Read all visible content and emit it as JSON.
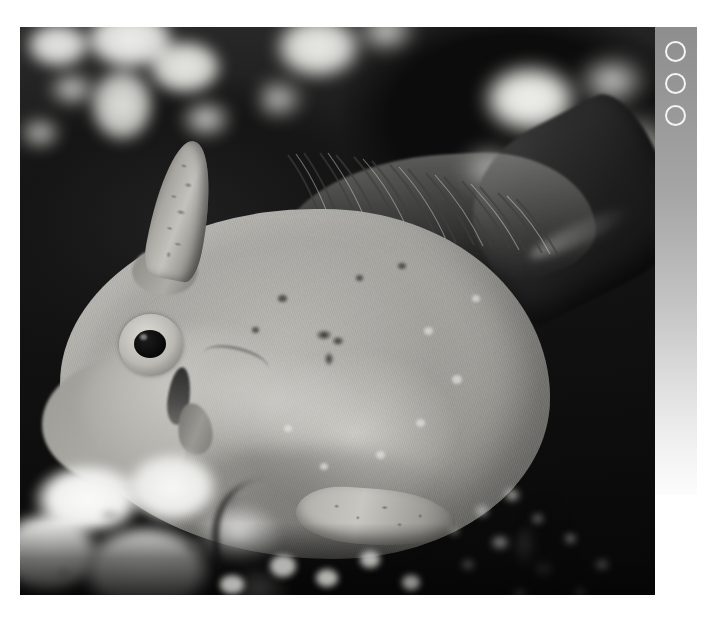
{
  "page": {
    "kind": "photograph",
    "rendering": "grayscale",
    "width": 710,
    "height": 624,
    "background_color": "#ffffff"
  },
  "photo": {
    "label": "Grayscale underwater photograph of a filefish beside coral",
    "frame": {
      "x": 20,
      "y": 27,
      "width": 635,
      "height": 568
    },
    "scene": {
      "background_description": "Dark water with blurred pale coral heads along the top",
      "foreground_description": "Bright white coral rubble at lower left and speckled coral at lower right",
      "dark_field_color": "#101010",
      "coral_highlight_color": "#f4f4f2"
    },
    "subject": {
      "name": "filefish",
      "orientation": "facing left, body in profile",
      "body_color": "#a6a5a0",
      "body_highlight_color": "#cccbc6",
      "body_shadow_color": "#8b8a85",
      "parts": [
        {
          "name": "dorsal-spine",
          "description": "erect textured spine above the head"
        },
        {
          "name": "eye",
          "description": "large round eye with dark pupil and pale iris ring"
        },
        {
          "name": "snout",
          "description": "tapered pointed snout at the left"
        },
        {
          "name": "dorsal-fin",
          "description": "soft dorsal fin with fine rays along the upper back"
        },
        {
          "name": "caudal-fin",
          "description": "dark tail fin angled to the upper right"
        },
        {
          "name": "anal-fin",
          "description": "mottled fin beneath the belly"
        },
        {
          "name": "pectoral-fin",
          "description": "small dark pectoral fin behind the gill"
        }
      ],
      "markings": [
        {
          "name": "dark-blotch",
          "description": "dark irregular blotch on the mid flank"
        },
        {
          "name": "pale-speckles",
          "description": "scattered pale dots across the body"
        },
        {
          "name": "gill-line",
          "description": "faint curved crease behind the head"
        }
      ]
    }
  },
  "sidebar": {
    "name": "registration-strip",
    "description": "Vertical gray strip along the right edge with three open circle marks",
    "background_gradient_top": "#8e8e8e",
    "background_gradient_bottom": "#fcfcfc",
    "ring_color": "#f4f4f4",
    "rings": [
      {
        "name": "ring-1"
      },
      {
        "name": "ring-2"
      },
      {
        "name": "ring-3"
      }
    ]
  }
}
